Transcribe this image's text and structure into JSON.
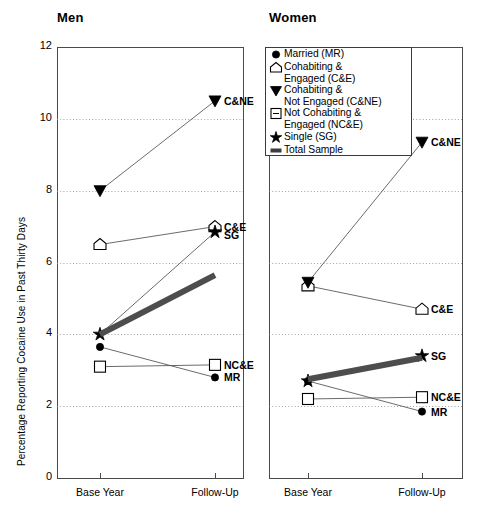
{
  "figure": {
    "ylabel": "Percentage Reporting Cocaine Use in Past Thirty Days",
    "yticks": [
      "0",
      "2",
      "4",
      "6",
      "8",
      "10",
      "12"
    ],
    "xticks": [
      "Base Year",
      "Follow-Up"
    ]
  },
  "panels": [
    {
      "title": "Men"
    },
    {
      "title": "Women"
    }
  ],
  "legend": {
    "items": [
      {
        "glyph": "filled-circle",
        "label": "Married (MR)"
      },
      {
        "glyph": "open-pentagon",
        "label": "Cohabiting &\nEngaged (C&E)"
      },
      {
        "glyph": "filled-triangle-down",
        "label": "Cohabiting &\nNot Engaged (C&NE)"
      },
      {
        "glyph": "open-square",
        "label": "Not Cohabiting &\nEngaged (NC&E)"
      },
      {
        "glyph": "star",
        "label": "Single (SG)"
      },
      {
        "glyph": "thick-bar",
        "label": "Total Sample"
      }
    ]
  },
  "chart_data": {
    "type": "line",
    "title": "",
    "xlabel": "",
    "ylabel": "Percentage Reporting Cocaine Use in Past Thirty Days",
    "x": [
      "Base Year",
      "Follow-Up"
    ],
    "ylim": [
      0,
      12
    ],
    "yticks": [
      0,
      2,
      4,
      6,
      8,
      10,
      12
    ],
    "grid": "horizontal-dotted",
    "legend_position": "top-center-of-women-panel",
    "panels": [
      {
        "name": "Men",
        "series": [
          {
            "name": "Married (MR)",
            "abbr": "MR",
            "marker": "filled-circle",
            "values": [
              3.65,
              2.8
            ],
            "end_label": "MR"
          },
          {
            "name": "Cohabiting & Engaged (C&E)",
            "abbr": "C&E",
            "marker": "open-pentagon",
            "values": [
              6.5,
              7.0
            ],
            "end_label": "C&E"
          },
          {
            "name": "Cohabiting & Not Engaged (C&NE)",
            "abbr": "C&NE",
            "marker": "filled-triangle-down",
            "values": [
              8.0,
              10.5
            ],
            "end_label": "C&NE"
          },
          {
            "name": "Not Cohabiting & Engaged (NC&E)",
            "abbr": "NC&E",
            "marker": "open-square",
            "values": [
              3.1,
              3.15
            ],
            "end_label": "NC&E"
          },
          {
            "name": "Single (SG)",
            "abbr": "SG",
            "marker": "star",
            "values": [
              4.0,
              6.85
            ],
            "end_label": "SG"
          },
          {
            "name": "Total Sample",
            "abbr": "Total",
            "marker": "thick-bar",
            "values": [
              4.0,
              5.65
            ],
            "end_label": ""
          }
        ]
      },
      {
        "name": "Women",
        "series": [
          {
            "name": "Married (MR)",
            "abbr": "MR",
            "marker": "filled-circle",
            "values": [
              2.7,
              1.85
            ],
            "end_label": "MR"
          },
          {
            "name": "Cohabiting & Engaged (C&E)",
            "abbr": "C&E",
            "marker": "open-pentagon",
            "values": [
              5.35,
              4.7
            ],
            "end_label": "C&E"
          },
          {
            "name": "Cohabiting & Not Engaged (C&NE)",
            "abbr": "C&NE",
            "marker": "filled-triangle-down",
            "values": [
              5.45,
              9.35
            ],
            "end_label": "C&NE"
          },
          {
            "name": "Not Cohabiting & Engaged (NC&E)",
            "abbr": "NC&E",
            "marker": "open-square",
            "values": [
              2.2,
              2.25
            ],
            "end_label": "NC&E"
          },
          {
            "name": "Single (SG)",
            "abbr": "SG",
            "marker": "star",
            "values": [
              2.7,
              3.4
            ],
            "end_label": "SG"
          },
          {
            "name": "Total Sample",
            "abbr": "Total",
            "marker": "thick-bar",
            "values": [
              2.75,
              3.35
            ],
            "end_label": ""
          }
        ]
      }
    ]
  }
}
